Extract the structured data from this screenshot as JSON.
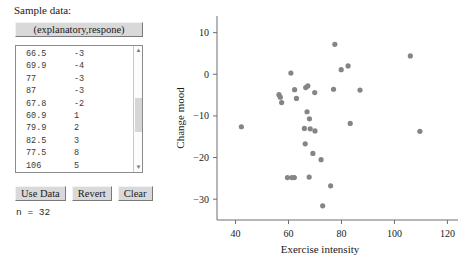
{
  "panel": {
    "title": "Sample data:",
    "variable_header": "(explanatory,respone)",
    "buttons": {
      "use_data": "Use Data",
      "revert": "Revert",
      "clear": "Clear"
    },
    "n_label": "n = 32",
    "scrollbar": {
      "up_arrow": "▲",
      "down_arrow": "▼"
    },
    "visible_rows": [
      {
        "x": "66.5",
        "y": "-3"
      },
      {
        "x": "69.9",
        "y": "-4"
      },
      {
        "x": "77",
        "y": "-3"
      },
      {
        "x": "87",
        "y": "-3"
      },
      {
        "x": "67.8",
        "y": "-2"
      },
      {
        "x": "60.9",
        "y": "1"
      },
      {
        "x": "79.9",
        "y": "2"
      },
      {
        "x": "82.5",
        "y": "3"
      },
      {
        "x": "77.5",
        "y": "8"
      },
      {
        "x": "106",
        "y": "5"
      }
    ]
  },
  "chart_data": {
    "type": "scatter",
    "title": "",
    "xlabel": "Exercise intensity",
    "ylabel": "Change mood",
    "xlim": [
      33,
      124
    ],
    "ylim": [
      -35,
      14
    ],
    "xticks": [
      40,
      60,
      80,
      100,
      120
    ],
    "yticks": [
      10,
      0,
      -10,
      -20,
      -30
    ],
    "xticklabels": [
      "40",
      "60",
      "80",
      "100",
      "120"
    ],
    "yticklabels": [
      "10",
      "0",
      "−10",
      "−20",
      "−30"
    ],
    "grid": false,
    "legend": false,
    "marker_color": "#858585",
    "n": 32,
    "points": [
      {
        "x": 42.2,
        "y": -12.6
      },
      {
        "x": 56.4,
        "y": -4.9
      },
      {
        "x": 56.9,
        "y": -5.5
      },
      {
        "x": 57.4,
        "y": -6.8
      },
      {
        "x": 59.6,
        "y": -24.8
      },
      {
        "x": 61.3,
        "y": -24.8
      },
      {
        "x": 62.2,
        "y": -24.8
      },
      {
        "x": 60.9,
        "y": 0.3
      },
      {
        "x": 62.3,
        "y": -3.7
      },
      {
        "x": 63.0,
        "y": -5.8
      },
      {
        "x": 66.0,
        "y": -13.0
      },
      {
        "x": 66.3,
        "y": -16.7
      },
      {
        "x": 66.5,
        "y": -3.2
      },
      {
        "x": 67.3,
        "y": -2.8
      },
      {
        "x": 67.8,
        "y": -24.7
      },
      {
        "x": 67.0,
        "y": -9.0
      },
      {
        "x": 67.9,
        "y": -10.7
      },
      {
        "x": 68.2,
        "y": -13.1
      },
      {
        "x": 69.9,
        "y": -4.4
      },
      {
        "x": 69.2,
        "y": -19.0
      },
      {
        "x": 70.0,
        "y": -13.6
      },
      {
        "x": 72.3,
        "y": -20.5
      },
      {
        "x": 72.9,
        "y": -31.6
      },
      {
        "x": 75.9,
        "y": -26.8
      },
      {
        "x": 77.0,
        "y": -3.6
      },
      {
        "x": 77.5,
        "y": 7.2
      },
      {
        "x": 79.9,
        "y": 1.1
      },
      {
        "x": 82.5,
        "y": 2.0
      },
      {
        "x": 83.3,
        "y": -11.8
      },
      {
        "x": 87.0,
        "y": -3.8
      },
      {
        "x": 106.0,
        "y": 4.4
      },
      {
        "x": 109.6,
        "y": -13.7
      }
    ]
  }
}
